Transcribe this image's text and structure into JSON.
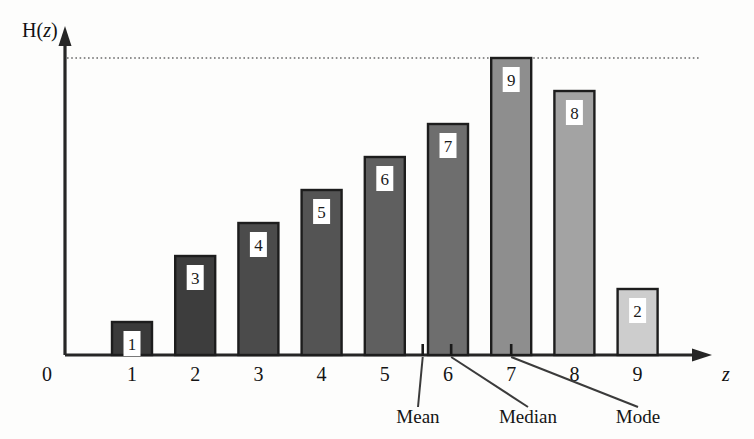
{
  "chart_data": {
    "type": "bar",
    "title": "",
    "subtitle": "",
    "xlabel": "z",
    "ylabel": "H(z)",
    "categories": [
      "1",
      "2",
      "3",
      "4",
      "5",
      "6",
      "7",
      "8",
      "9"
    ],
    "values": [
      1,
      3,
      4,
      5,
      6,
      7,
      9,
      8,
      2
    ],
    "value_labels": [
      "1",
      "3",
      "4",
      "5",
      "6",
      "7",
      "9",
      "8",
      "2"
    ],
    "xtick_labels": [
      "1",
      "2",
      "3",
      "4",
      "5",
      "6",
      "7",
      "8",
      "9"
    ],
    "origin_label": "0",
    "ylim": [
      0,
      9.6
    ],
    "xlim": [
      0.3,
      9.8
    ],
    "grid": false,
    "legend": null,
    "bar_colors": [
      "#3a3a3a",
      "#3d3d3d",
      "#4b4b4b",
      "#545454",
      "#5f5f5f",
      "#6e6e6e",
      "#8e8e8e",
      "#a3a3a3",
      "#cdcdcd"
    ],
    "bar_edge_color": "#1d1d1d",
    "reference_line": {
      "y": 9,
      "style": "dotted",
      "color": "#6a6a6a"
    },
    "annotations": [
      {
        "name": "mean",
        "label": "Mean",
        "x": 5.6
      },
      {
        "name": "median",
        "label": "Median",
        "x": 6.05
      },
      {
        "name": "mode",
        "label": "Mode",
        "x": 7.0
      }
    ]
  },
  "axes": {
    "y_axis_label": "H(z)",
    "y_axis_label_roman": "H(",
    "y_axis_label_italic": "z",
    "y_axis_label_close": ")",
    "x_axis_label": "z",
    "origin": "0"
  }
}
